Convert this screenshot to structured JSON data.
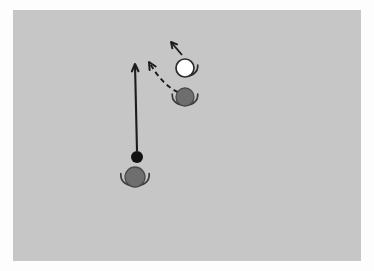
{
  "scene": {
    "title": "Soccer tactic diagram",
    "outer_background": "#fdfdfd",
    "field_color": "#c6c6c6",
    "field": {
      "x": 13,
      "y": 10,
      "width": 348,
      "height": 251
    }
  },
  "colors": {
    "ball": "#111111",
    "player_dark": "#6e6e6e",
    "player_dark_stroke": "#3a3a3a",
    "player_light": "#ffffff",
    "player_light_stroke": "#2b2b2b",
    "movement_line": "#1c1c1c",
    "pass_line": "#1c1c1c"
  },
  "objects": {
    "ball": {
      "label": "ball",
      "cx": 137,
      "cy": 157,
      "r": 6
    },
    "player_bottom": {
      "label": "player-bottom",
      "cx": 135,
      "cy": 177,
      "r": 10,
      "fill": "#6e6e6e",
      "arms": "both"
    },
    "player_dark_right": {
      "label": "player-dark-right",
      "cx": 185,
      "cy": 97,
      "r": 9,
      "fill": "#6e6e6e",
      "arms": "both"
    },
    "player_light_right": {
      "label": "player-light-right",
      "cx": 185,
      "cy": 68,
      "r": 9,
      "fill": "#ffffff",
      "arms": "right"
    }
  },
  "annotations": {
    "solid_arrow": {
      "label": "movement-arrow",
      "style": "solid",
      "from": {
        "x": 137,
        "y": 151
      },
      "to": {
        "x": 135,
        "y": 64
      }
    },
    "dashed_arrow": {
      "label": "pass-arrow",
      "style": "dashed",
      "from": {
        "x": 178,
        "y": 92
      },
      "control": {
        "x": 163,
        "y": 86
      },
      "to": {
        "x": 149,
        "y": 62
      }
    },
    "small_arrow": {
      "label": "run-arrow",
      "style": "solid",
      "from": {
        "x": 182,
        "y": 55
      },
      "to": {
        "x": 171,
        "y": 42
      }
    }
  }
}
